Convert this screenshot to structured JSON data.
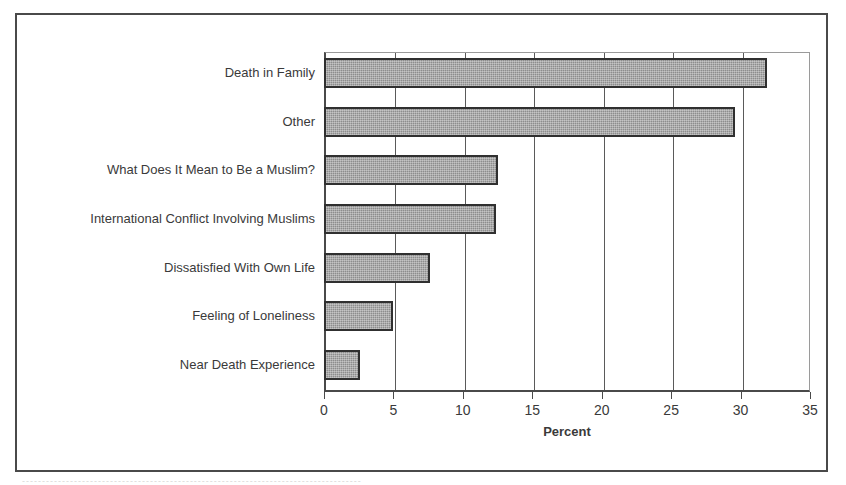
{
  "figure": {
    "caption_fragment": "-------------------------------------------------------------------------------------"
  },
  "chart_data": {
    "type": "bar",
    "orientation": "horizontal",
    "title": "",
    "subtitle": "",
    "xlabel": "Percent",
    "ylabel": "",
    "categories": [
      "Death in Family",
      "Other",
      "What Does It Mean to Be a Muslim?",
      "International Conflict Involving Muslims",
      "Dissatisfied With Own Life",
      "Feeling of Loneliness",
      "Near Death Experience"
    ],
    "values": [
      31.9,
      29.6,
      12.5,
      12.4,
      7.6,
      5.0,
      2.6
    ],
    "xlim": [
      0,
      35
    ],
    "xticks": [
      0,
      5,
      10,
      15,
      20,
      25,
      30,
      35
    ],
    "xtick_labels": [
      "0",
      "5",
      "10",
      "15",
      "20",
      "25",
      "30",
      "35"
    ],
    "grid": "vertical",
    "legend": "none",
    "bar_color": "#8d8d8d",
    "bar_edge_color": "#303030",
    "frame_color": "#4a4a4a"
  }
}
